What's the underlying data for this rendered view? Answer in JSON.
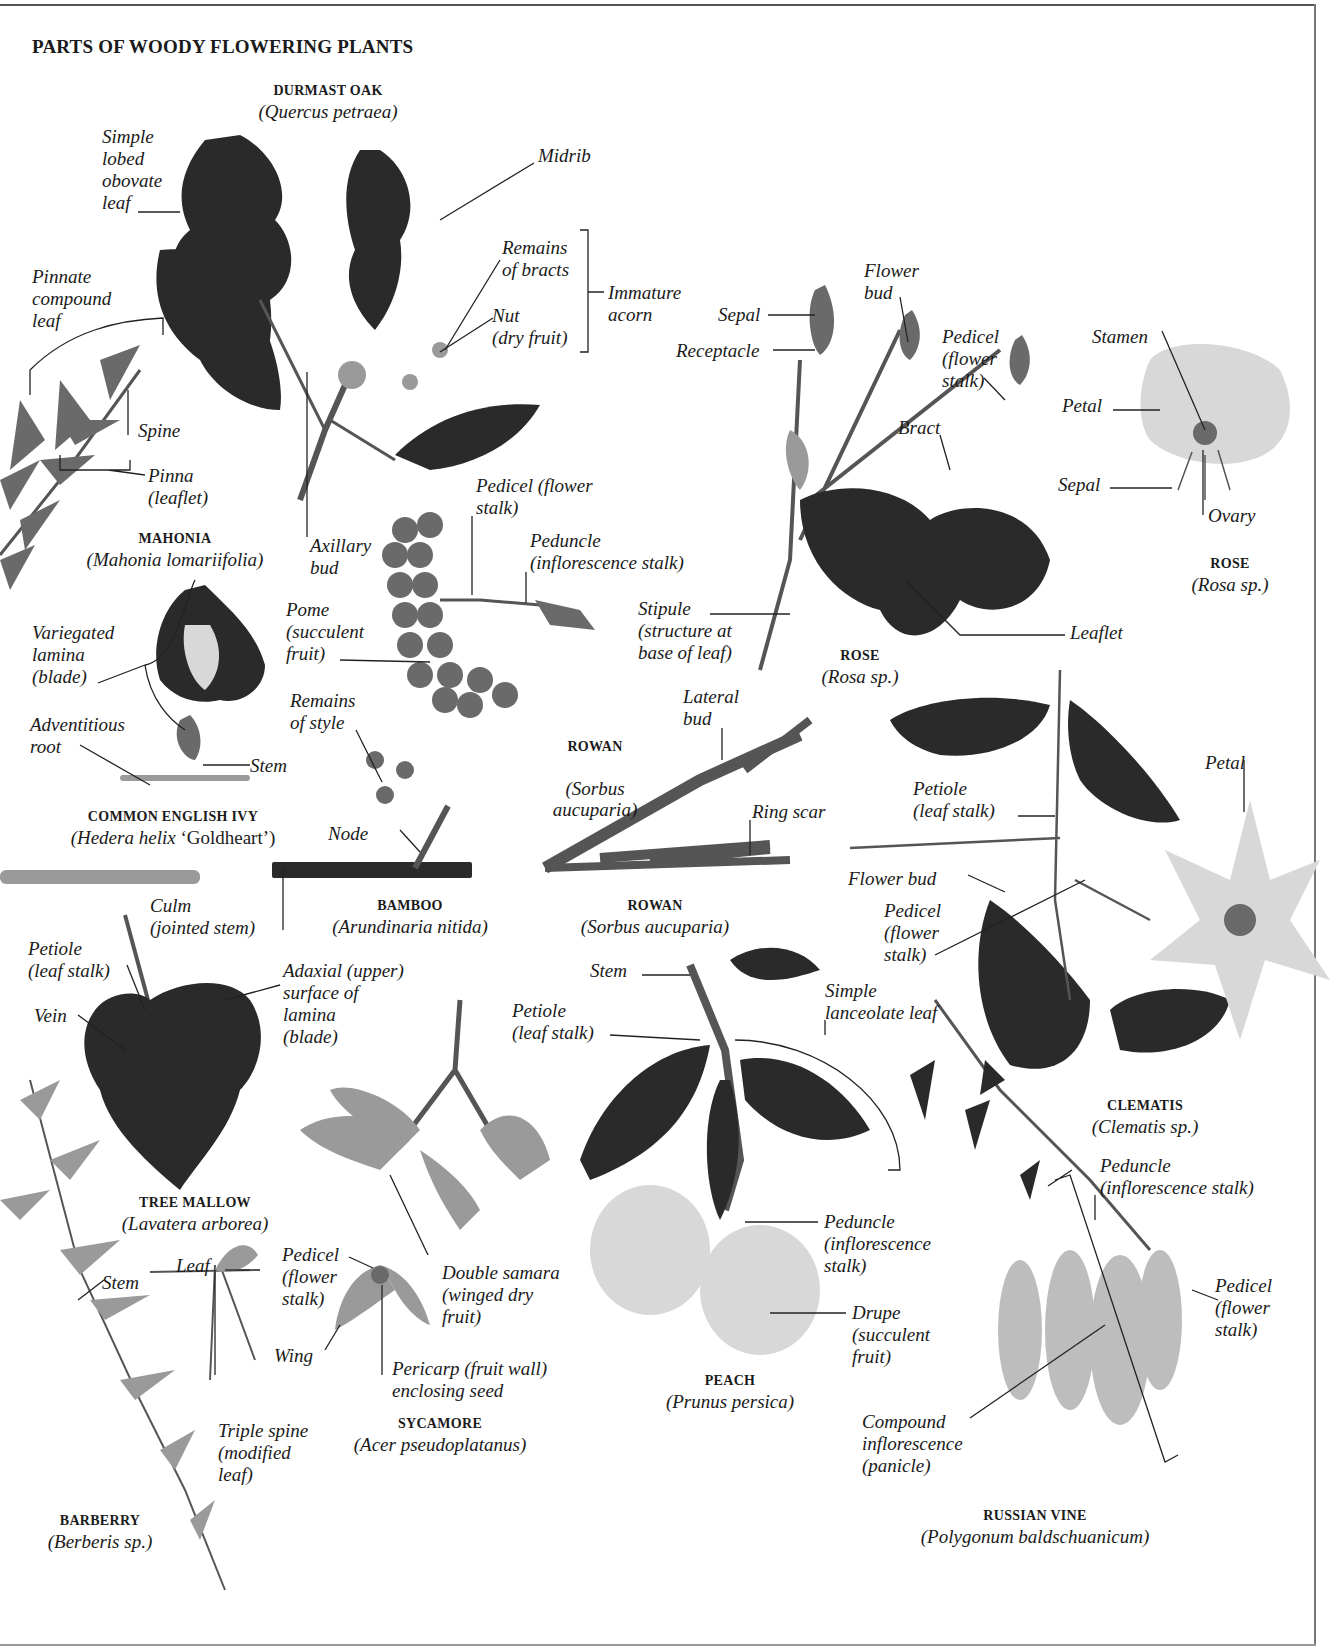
{
  "page": {
    "title": "PARTS OF WOODY FLOWERING PLANTS"
  },
  "specimens": {
    "durmast_oak": {
      "common": "DURMAST OAK",
      "latin": "(Quercus petraea)"
    },
    "mahonia": {
      "common": "MAHONIA",
      "latin": "(Mahonia lomariifolia)"
    },
    "rose_top": {
      "common": "ROSE",
      "latin": "(Rosa sp.)"
    },
    "rose_mid": {
      "common": "ROSE",
      "latin": "(Rosa sp.)"
    },
    "ivy": {
      "common": "COMMON ENGLISH IVY",
      "latin_italic": "(Hedera helix",
      "latin_roman": " ‘Goldheart’)"
    },
    "rowan_fruit": {
      "common": "ROWAN",
      "latin": "(Sorbus\naucuparia)"
    },
    "rowan_twig": {
      "common": "ROWAN",
      "latin": "(Sorbus aucuparia)"
    },
    "bamboo": {
      "common": "BAMBOO",
      "latin": "(Arundinaria nitida)"
    },
    "clematis": {
      "common": "CLEMATIS",
      "latin": "(Clematis sp.)"
    },
    "tree_mallow": {
      "common": "TREE MALLOW",
      "latin": "(Lavatera arborea)"
    },
    "sycamore": {
      "common": "SYCAMORE",
      "latin": "(Acer pseudoplatanus)"
    },
    "peach": {
      "common": "PEACH",
      "latin": "(Prunus persica)"
    },
    "barberry": {
      "common": "BARBERRY",
      "latin": "(Berberis sp.)"
    },
    "russian_vine": {
      "common": "RUSSIAN VINE",
      "latin": "(Polygonum baldschuanicum)"
    }
  },
  "labels": {
    "oak_simple_leaf": "Simple\nlobed\nobovate\nleaf",
    "oak_midrib": "Midrib",
    "oak_remains_bracts": "Remains\nof bracts",
    "oak_nut": "Nut\n(dry fruit)",
    "oak_immature_acorn": "Immature\nacorn",
    "oak_axillary_bud": "Axillary\nbud",
    "mahonia_pinnate_leaf": "Pinnate\ncompound\nleaf",
    "mahonia_spine": "Spine",
    "mahonia_pinna": "Pinna\n(leaflet)",
    "rose_sepal_bud": "Sepal",
    "rose_receptacle": "Receptacle",
    "rose_flower_bud": "Flower\nbud",
    "rose_pedicel": "Pedicel\n(flower\nstalk)",
    "rose_bract": "Bract",
    "rose_stamen": "Stamen",
    "rose_petal": "Petal",
    "rose_sepal_flower": "Sepal",
    "rose_ovary": "Ovary",
    "rose_stipule": "Stipule\n(structure at\nbase of leaf)",
    "rose_leaflet": "Leaflet",
    "rowan_pedicel": "Pedicel (flower\nstalk)",
    "rowan_peduncle": "Peduncle\n(inflorescence stalk)",
    "rowan_pome": "Pome\n(succulent\nfruit)",
    "rowan_remains_style": "Remains\nof style",
    "rowan_lateral_bud": "Lateral\nbud",
    "rowan_ring_scar": "Ring scar",
    "ivy_variegated": "Variegated\nlamina\n(blade)",
    "ivy_adventitious_root": "Adventitious\nroot",
    "ivy_stem": "Stem",
    "bamboo_node": "Node",
    "bamboo_culm": "Culm\n(jointed stem)",
    "clematis_petal": "Petal",
    "clematis_petiole": "Petiole\n(leaf stalk)",
    "clematis_flower_bud": "Flower bud",
    "clematis_pedicel": "Pedicel\n(flower\nstalk)",
    "mallow_petiole": "Petiole\n(leaf stalk)",
    "mallow_vein": "Vein",
    "mallow_adaxial": "Adaxial (upper)\nsurface of\nlamina\n(blade)",
    "peach_stem": "Stem",
    "peach_petiole": "Petiole\n(leaf stalk)",
    "peach_simple_leaf": "Simple\nlanceolate leaf",
    "peach_peduncle": "Peduncle\n(inflorescence\nstalk)",
    "peach_drupe": "Drupe\n(succulent\nfruit)",
    "sycamore_double_samara": "Double samara\n(winged dry\nfruit)",
    "sycamore_pedicel": "Pedicel\n(flower\nstalk)",
    "sycamore_wing": "Wing",
    "sycamore_pericarp": "Pericarp (fruit wall)\nenclosing seed",
    "barberry_stem": "Stem",
    "barberry_leaf": "Leaf",
    "barberry_triple_spine": "Triple spine\n(modified\nleaf)",
    "vine_peduncle": "Peduncle\n(inflorescence stalk)",
    "vine_pedicel": "Pedicel\n(flower\nstalk)",
    "vine_compound": "Compound\ninflorescence\n(panicle)"
  }
}
